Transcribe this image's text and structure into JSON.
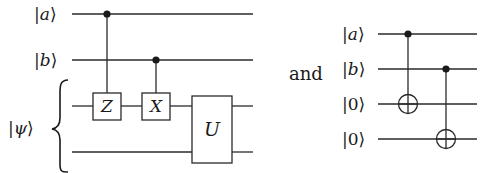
{
  "left_circuit": {
    "inputs": [
      {
        "label_open": "|",
        "label_var": "a",
        "label_close": "⟩"
      },
      {
        "label_open": "|",
        "label_var": "b",
        "label_close": "⟩"
      }
    ],
    "register": {
      "label_open": "|",
      "label_var": "ψ",
      "label_close": "⟩",
      "brace": "{"
    },
    "gates": [
      {
        "name": "Z",
        "type": "controlled",
        "control": "a"
      },
      {
        "name": "X",
        "type": "controlled",
        "control": "b"
      },
      {
        "name": "U",
        "type": "two-qubit",
        "target": "ψ"
      }
    ]
  },
  "connector": {
    "text": "and"
  },
  "right_circuit": {
    "inputs": [
      {
        "label_open": "|",
        "label_var": "a",
        "label_close": "⟩"
      },
      {
        "label_open": "|",
        "label_var": "b",
        "label_close": "⟩"
      },
      {
        "label": "|0⟩"
      },
      {
        "label": "|0⟩"
      }
    ],
    "gates": [
      {
        "type": "CNOT",
        "control": "a",
        "target": "ancilla1"
      },
      {
        "type": "CNOT",
        "control": "b",
        "target": "ancilla2"
      }
    ]
  },
  "colors": {
    "line": "#2a2a2a",
    "text": "#1a1a1a",
    "background": "#ffffff"
  }
}
